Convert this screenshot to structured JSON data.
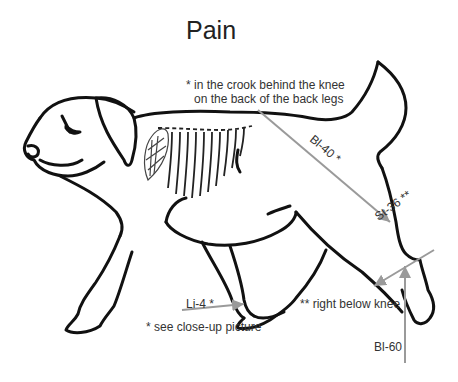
{
  "diagram": {
    "title": "Pain",
    "colors": {
      "outline": "#111111",
      "arrow": "#9a9a9a",
      "text": "#333333",
      "background": "#ffffff"
    },
    "notes": {
      "crook": [
        "* in the crook behind the knee",
        "on the back of the back legs"
      ],
      "closeup": "* see close-up picture",
      "below_knee": "** right below knee"
    },
    "points": [
      {
        "id": "bl40",
        "label": "Bl-40 *"
      },
      {
        "id": "st36",
        "label": "St-36 **"
      },
      {
        "id": "li4",
        "label": "Li-4 *"
      },
      {
        "id": "bl60",
        "label": "Bl-60"
      }
    ]
  }
}
